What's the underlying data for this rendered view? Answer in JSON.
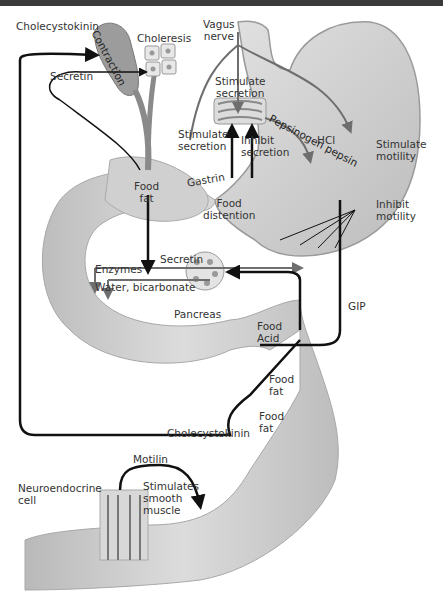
{
  "diagram": {
    "colors": {
      "organ_fill": "#c8c8c8",
      "organ_light": "#e6e6e6",
      "arrow_black": "#111111",
      "nerve_gray": "#6e6e6e",
      "text": "#333333",
      "top_bar": "#3a3a3a"
    },
    "labels": {
      "cholecystokinin_top": "Cholecystokinin",
      "contraction": "Contraction",
      "choleresis": "Choleresis",
      "vagus_nerve_line1": "Vagus",
      "vagus_nerve_line2": "nerve",
      "secretin_top": "Secretin",
      "stimulate_secretion_top_line1": "Stimulate",
      "stimulate_secretion_top_line2": "secretion",
      "hcl": "HCl",
      "pepsinogen_pepsin": "Pepsinogen pepsin",
      "stimulate_motility_line1": "Stimulate",
      "stimulate_motility_line2": "motility",
      "stimulate_secretion_left_line1": "Stimulate",
      "stimulate_secretion_left_line2": "secretion",
      "inhibit_secretion_line1": "Inhibit",
      "inhibit_secretion_line2": "secretion",
      "gastrin": "Gastrin",
      "food_fat_duodenum_line1": "Food",
      "food_fat_duodenum_line2": "fat",
      "food_distention_line1": "Food",
      "food_distention_line2": "distention",
      "inhibit_motility_line1": "Inhibit",
      "inhibit_motility_line2": "motility",
      "secretin_pancreas": "Secretin",
      "enzymes": "Enzymes",
      "water_bicarbonate": "Water, bicarbonate",
      "pancreas": "Pancreas",
      "gip": "GIP",
      "food_acid_line1": "Food",
      "food_acid_line2": "Acid",
      "food_fat_mid_line1": "Food",
      "food_fat_mid_line2": "fat",
      "food_fat_low_line1": "Food",
      "food_fat_low_line2": "fat",
      "cholecystokinin_bottom": "Cholecystokinin",
      "motilin": "Motilin",
      "neuroendocrine_line1": "Neuroendocrine",
      "neuroendocrine_line2": "cell",
      "stimulates_smooth_muscle_line1": "Stimulates",
      "stimulates_smooth_muscle_line2": "smooth",
      "stimulates_smooth_muscle_line3": "muscle"
    },
    "structures": [
      "gallbladder",
      "bile-duct",
      "liver-cells",
      "stomach",
      "gastric-gland",
      "duodenum",
      "pancreas-acinus",
      "jejunum",
      "ileum",
      "intestinal-villi"
    ]
  }
}
